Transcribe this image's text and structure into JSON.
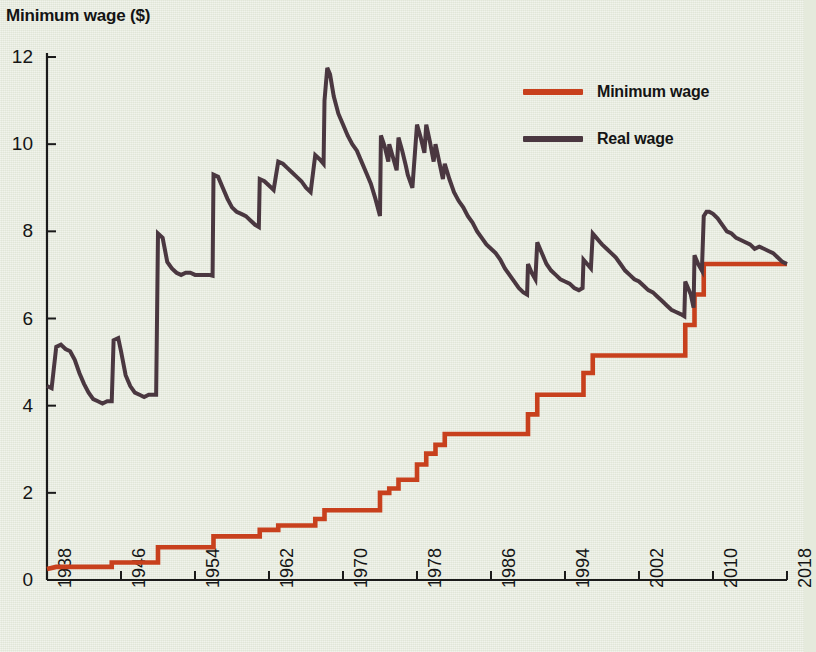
{
  "chart_data": {
    "type": "line",
    "title": "Minimum wage ($)",
    "xlabel": "",
    "ylabel": "Minimum wage ($)",
    "xlim": [
      1938,
      2018
    ],
    "ylim": [
      0,
      12
    ],
    "grid": false,
    "legend_position": "top-right",
    "x_ticks": [
      "1938",
      "1946",
      "1954",
      "1962",
      "1970",
      "1978",
      "1986",
      "1994",
      "2002",
      "2010",
      "2018"
    ],
    "y_ticks": [
      "0",
      "2",
      "4",
      "6",
      "8",
      "10",
      "12"
    ],
    "colors": {
      "minimum_wage": "#c8401d",
      "real_wage": "#4a3740",
      "background": "#e5eadc",
      "axis": "#1a1a1a"
    },
    "series": [
      {
        "name": "Minimum wage",
        "color": "#c8401d",
        "style": "step",
        "points": [
          [
            1938,
            0.25
          ],
          [
            1939,
            0.3
          ],
          [
            1945,
            0.3
          ],
          [
            1945,
            0.4
          ],
          [
            1950,
            0.4
          ],
          [
            1950,
            0.75
          ],
          [
            1956,
            0.75
          ],
          [
            1956,
            1.0
          ],
          [
            1961,
            1.0
          ],
          [
            1961,
            1.15
          ],
          [
            1963,
            1.15
          ],
          [
            1963,
            1.25
          ],
          [
            1967,
            1.25
          ],
          [
            1967,
            1.4
          ],
          [
            1968,
            1.4
          ],
          [
            1968,
            1.6
          ],
          [
            1974,
            1.6
          ],
          [
            1974,
            2.0
          ],
          [
            1975,
            2.0
          ],
          [
            1975,
            2.1
          ],
          [
            1976,
            2.1
          ],
          [
            1976,
            2.3
          ],
          [
            1978,
            2.3
          ],
          [
            1978,
            2.65
          ],
          [
            1979,
            2.65
          ],
          [
            1979,
            2.9
          ],
          [
            1980,
            2.9
          ],
          [
            1980,
            3.1
          ],
          [
            1981,
            3.1
          ],
          [
            1981,
            3.35
          ],
          [
            1990,
            3.35
          ],
          [
            1990,
            3.8
          ],
          [
            1991,
            3.8
          ],
          [
            1991,
            4.25
          ],
          [
            1996,
            4.25
          ],
          [
            1996,
            4.75
          ],
          [
            1997,
            4.75
          ],
          [
            1997,
            5.15
          ],
          [
            2007,
            5.15
          ],
          [
            2007,
            5.85
          ],
          [
            2008,
            5.85
          ],
          [
            2008,
            6.55
          ],
          [
            2009,
            6.55
          ],
          [
            2009,
            7.25
          ],
          [
            2018,
            7.25
          ]
        ]
      },
      {
        "name": "Real wage",
        "color": "#4a3740",
        "style": "line",
        "points": [
          [
            1938,
            4.45
          ],
          [
            1938.5,
            4.4
          ],
          [
            1939,
            5.35
          ],
          [
            1939.5,
            5.4
          ],
          [
            1940,
            5.3
          ],
          [
            1940.5,
            5.25
          ],
          [
            1941,
            5.05
          ],
          [
            1941.5,
            4.75
          ],
          [
            1942,
            4.5
          ],
          [
            1942.5,
            4.3
          ],
          [
            1943,
            4.15
          ],
          [
            1943.5,
            4.1
          ],
          [
            1944,
            4.05
          ],
          [
            1944.5,
            4.1
          ],
          [
            1945,
            4.1
          ],
          [
            1945.2,
            5.5
          ],
          [
            1945.7,
            5.55
          ],
          [
            1946,
            5.25
          ],
          [
            1946.5,
            4.7
          ],
          [
            1947,
            4.45
          ],
          [
            1947.5,
            4.3
          ],
          [
            1948,
            4.25
          ],
          [
            1948.5,
            4.2
          ],
          [
            1949,
            4.25
          ],
          [
            1949.8,
            4.25
          ],
          [
            1950,
            7.95
          ],
          [
            1950.5,
            7.85
          ],
          [
            1951,
            7.3
          ],
          [
            1951.5,
            7.15
          ],
          [
            1952,
            7.05
          ],
          [
            1952.5,
            7.0
          ],
          [
            1953,
            7.05
          ],
          [
            1953.5,
            7.05
          ],
          [
            1954,
            7.0
          ],
          [
            1954.5,
            7.0
          ],
          [
            1955,
            7.0
          ],
          [
            1955.5,
            7.0
          ],
          [
            1955.9,
            6.98
          ],
          [
            1956,
            9.3
          ],
          [
            1956.5,
            9.25
          ],
          [
            1957,
            9.0
          ],
          [
            1957.5,
            8.75
          ],
          [
            1958,
            8.55
          ],
          [
            1958.5,
            8.45
          ],
          [
            1959,
            8.4
          ],
          [
            1959.5,
            8.35
          ],
          [
            1960,
            8.25
          ],
          [
            1960.5,
            8.15
          ],
          [
            1960.9,
            8.1
          ],
          [
            1961,
            9.2
          ],
          [
            1961.5,
            9.15
          ],
          [
            1962,
            9.05
          ],
          [
            1962.5,
            8.95
          ],
          [
            1963,
            9.6
          ],
          [
            1963.5,
            9.55
          ],
          [
            1964,
            9.45
          ],
          [
            1964.5,
            9.35
          ],
          [
            1965,
            9.25
          ],
          [
            1965.5,
            9.15
          ],
          [
            1966,
            9.0
          ],
          [
            1966.5,
            8.9
          ],
          [
            1967,
            9.75
          ],
          [
            1967.5,
            9.65
          ],
          [
            1967.9,
            9.55
          ],
          [
            1968,
            11.0
          ],
          [
            1968.3,
            11.75
          ],
          [
            1968.6,
            11.6
          ],
          [
            1969,
            11.1
          ],
          [
            1969.5,
            10.7
          ],
          [
            1970,
            10.45
          ],
          [
            1970.5,
            10.2
          ],
          [
            1971,
            10.0
          ],
          [
            1971.5,
            9.85
          ],
          [
            1972,
            9.6
          ],
          [
            1972.5,
            9.35
          ],
          [
            1973,
            9.1
          ],
          [
            1973.5,
            8.75
          ],
          [
            1974,
            8.35
          ],
          [
            1974.1,
            10.2
          ],
          [
            1974.5,
            9.95
          ],
          [
            1974.9,
            9.6
          ],
          [
            1975,
            10.0
          ],
          [
            1975.4,
            9.7
          ],
          [
            1975.8,
            9.4
          ],
          [
            1976,
            10.15
          ],
          [
            1976.4,
            9.85
          ],
          [
            1976.8,
            9.5
          ],
          [
            1977,
            9.3
          ],
          [
            1977.5,
            9.0
          ],
          [
            1978,
            10.45
          ],
          [
            1978.4,
            10.15
          ],
          [
            1978.8,
            9.8
          ],
          [
            1979,
            10.45
          ],
          [
            1979.4,
            10.05
          ],
          [
            1979.8,
            9.6
          ],
          [
            1980,
            10.0
          ],
          [
            1980.4,
            9.6
          ],
          [
            1980.8,
            9.2
          ],
          [
            1981,
            9.55
          ],
          [
            1981.5,
            9.2
          ],
          [
            1982,
            8.9
          ],
          [
            1982.5,
            8.7
          ],
          [
            1983,
            8.55
          ],
          [
            1983.5,
            8.35
          ],
          [
            1984,
            8.2
          ],
          [
            1984.5,
            8.0
          ],
          [
            1985,
            7.85
          ],
          [
            1985.5,
            7.7
          ],
          [
            1986,
            7.6
          ],
          [
            1986.5,
            7.5
          ],
          [
            1987,
            7.35
          ],
          [
            1987.5,
            7.15
          ],
          [
            1988,
            7.0
          ],
          [
            1988.5,
            6.85
          ],
          [
            1989,
            6.7
          ],
          [
            1989.5,
            6.6
          ],
          [
            1989.9,
            6.55
          ],
          [
            1990,
            7.25
          ],
          [
            1990.4,
            7.05
          ],
          [
            1990.8,
            6.9
          ],
          [
            1991,
            7.75
          ],
          [
            1991.4,
            7.55
          ],
          [
            1991.8,
            7.35
          ],
          [
            1992,
            7.25
          ],
          [
            1992.5,
            7.1
          ],
          [
            1993,
            7.0
          ],
          [
            1993.5,
            6.9
          ],
          [
            1994,
            6.85
          ],
          [
            1994.5,
            6.8
          ],
          [
            1995,
            6.7
          ],
          [
            1995.5,
            6.65
          ],
          [
            1995.9,
            6.7
          ],
          [
            1996,
            7.35
          ],
          [
            1996.4,
            7.25
          ],
          [
            1996.8,
            7.15
          ],
          [
            1997,
            7.95
          ],
          [
            1997.4,
            7.85
          ],
          [
            1997.8,
            7.75
          ],
          [
            1998,
            7.7
          ],
          [
            1998.5,
            7.6
          ],
          [
            1999,
            7.5
          ],
          [
            1999.5,
            7.4
          ],
          [
            2000,
            7.25
          ],
          [
            2000.5,
            7.1
          ],
          [
            2001,
            7.0
          ],
          [
            2001.5,
            6.9
          ],
          [
            2002,
            6.85
          ],
          [
            2002.5,
            6.75
          ],
          [
            2003,
            6.65
          ],
          [
            2003.5,
            6.6
          ],
          [
            2004,
            6.5
          ],
          [
            2004.5,
            6.4
          ],
          [
            2005,
            6.3
          ],
          [
            2005.5,
            6.2
          ],
          [
            2006,
            6.15
          ],
          [
            2006.5,
            6.1
          ],
          [
            2006.9,
            6.05
          ],
          [
            2007,
            6.85
          ],
          [
            2007.3,
            6.7
          ],
          [
            2007.6,
            6.55
          ],
          [
            2007.9,
            6.25
          ],
          [
            2008,
            7.45
          ],
          [
            2008.4,
            7.25
          ],
          [
            2008.8,
            7.1
          ],
          [
            2009,
            8.35
          ],
          [
            2009.3,
            8.45
          ],
          [
            2009.6,
            8.45
          ],
          [
            2010,
            8.4
          ],
          [
            2010.5,
            8.3
          ],
          [
            2011,
            8.15
          ],
          [
            2011.5,
            8.0
          ],
          [
            2012,
            7.95
          ],
          [
            2012.5,
            7.85
          ],
          [
            2013,
            7.8
          ],
          [
            2013.5,
            7.75
          ],
          [
            2014,
            7.7
          ],
          [
            2014.5,
            7.6
          ],
          [
            2015,
            7.65
          ],
          [
            2015.5,
            7.6
          ],
          [
            2016,
            7.55
          ],
          [
            2016.5,
            7.5
          ],
          [
            2017,
            7.4
          ],
          [
            2017.5,
            7.3
          ],
          [
            2018,
            7.25
          ]
        ]
      }
    ]
  },
  "legend": {
    "items": [
      {
        "label": "Minimum wage",
        "color": "#c8401d"
      },
      {
        "label": "Real wage",
        "color": "#4a3740"
      }
    ]
  }
}
